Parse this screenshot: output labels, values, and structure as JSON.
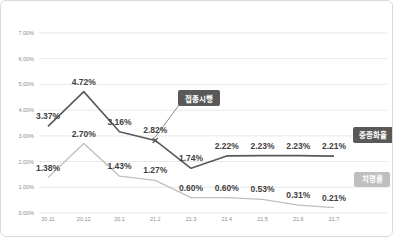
{
  "chart_data": {
    "type": "line",
    "title": "",
    "xlabel": "",
    "ylabel": "",
    "categories": [
      "20.11",
      "20.12",
      "20.1",
      "21.2",
      "21.3",
      "21.4",
      "21.5",
      "21.6",
      "21.7"
    ],
    "series": [
      {
        "name": "중증화율",
        "color": "#595959",
        "values": [
          3.37,
          4.72,
          3.16,
          2.82,
          1.74,
          2.22,
          2.23,
          2.23,
          2.21
        ],
        "labels": [
          "3.37%",
          "4.72%",
          "3.16%",
          "2.82%",
          "1.74%",
          "2.22%",
          "2.23%",
          "2.23%",
          "2.21%"
        ]
      },
      {
        "name": "치명률",
        "color": "#bfbfbf",
        "values": [
          1.38,
          2.7,
          1.43,
          1.27,
          0.6,
          0.6,
          0.53,
          0.31,
          0.21
        ],
        "labels": [
          "1.38%",
          "2.70%",
          "1.43%",
          "1.27%",
          "0.60%",
          "0.60%",
          "0.53%",
          "0.31%",
          "0.21%"
        ]
      }
    ],
    "ylim": [
      0,
      7
    ],
    "ytick_step": 1,
    "ytick_labels": [
      "0.00%",
      "1.00%",
      "2.00%",
      "3.00%",
      "4.00%",
      "5.00%",
      "6.00%",
      "7.00%"
    ],
    "grid": true,
    "legend_position": "inline-badges-right",
    "annotation": {
      "label": "접종시행",
      "target_category": "21.2",
      "target_series": "중증화율"
    },
    "series_badges": [
      {
        "label": "중증화율",
        "color": "#595959"
      },
      {
        "label": "치명률",
        "color": "#bfbfbf"
      }
    ]
  },
  "colors": {
    "frame_border": "#d9d9d9",
    "gridline": "#e8e8e8",
    "axis_text": "#8c8c8c",
    "data_label_text": "#3f3f3f",
    "badge_text": "#ffffff"
  }
}
